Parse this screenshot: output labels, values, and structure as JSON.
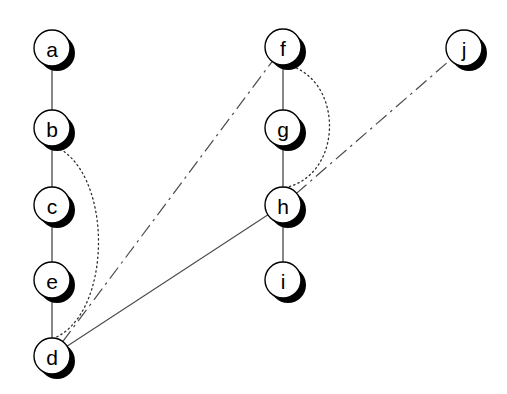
{
  "diagram": {
    "canvas": {
      "width": 507,
      "height": 394,
      "background": "#ffffff"
    },
    "node_style": {
      "radius": 18,
      "fill": "#ffffff",
      "stroke": "#000000",
      "shadow_color": "#000000",
      "shadow_offset_x": 5,
      "shadow_offset_y": 5
    },
    "nodes": [
      {
        "id": "a",
        "label": "a",
        "cx": 52,
        "cy": 48
      },
      {
        "id": "b",
        "label": "b",
        "cx": 52,
        "cy": 128
      },
      {
        "id": "c",
        "label": "c",
        "cx": 52,
        "cy": 205
      },
      {
        "id": "e",
        "label": "e",
        "cx": 52,
        "cy": 280
      },
      {
        "id": "d",
        "label": "d",
        "cx": 52,
        "cy": 356
      },
      {
        "id": "f",
        "label": "f",
        "cx": 283,
        "cy": 47
      },
      {
        "id": "g",
        "label": "g",
        "cx": 283,
        "cy": 128
      },
      {
        "id": "h",
        "label": "h",
        "cx": 283,
        "cy": 205
      },
      {
        "id": "i",
        "label": "i",
        "cx": 283,
        "cy": 280
      },
      {
        "id": "j",
        "label": "j",
        "cx": 464,
        "cy": 48
      }
    ],
    "edges": [
      {
        "id": "a-b",
        "from": "a",
        "to": "b",
        "style": "solid",
        "shape": "straight"
      },
      {
        "id": "b-c",
        "from": "b",
        "to": "c",
        "style": "solid",
        "shape": "straight"
      },
      {
        "id": "c-e",
        "from": "c",
        "to": "e",
        "style": "solid",
        "shape": "straight"
      },
      {
        "id": "e-d",
        "from": "e",
        "to": "d",
        "style": "solid",
        "shape": "straight"
      },
      {
        "id": "f-g",
        "from": "f",
        "to": "g",
        "style": "solid",
        "shape": "straight"
      },
      {
        "id": "g-h",
        "from": "g",
        "to": "h",
        "style": "solid",
        "shape": "straight"
      },
      {
        "id": "h-i",
        "from": "h",
        "to": "i",
        "style": "solid",
        "shape": "straight"
      },
      {
        "id": "b-d",
        "from": "b",
        "to": "d",
        "style": "dotted",
        "shape": "curved"
      },
      {
        "id": "f-h",
        "from": "f",
        "to": "h",
        "style": "dotted",
        "shape": "curved"
      },
      {
        "id": "d-f",
        "from": "d",
        "to": "f",
        "style": "dashdot",
        "shape": "straight"
      },
      {
        "id": "h-j",
        "from": "h",
        "to": "j",
        "style": "dashdot",
        "shape": "straight"
      },
      {
        "id": "d-h",
        "from": "d",
        "to": "h",
        "style": "solid",
        "shape": "straight"
      }
    ]
  }
}
